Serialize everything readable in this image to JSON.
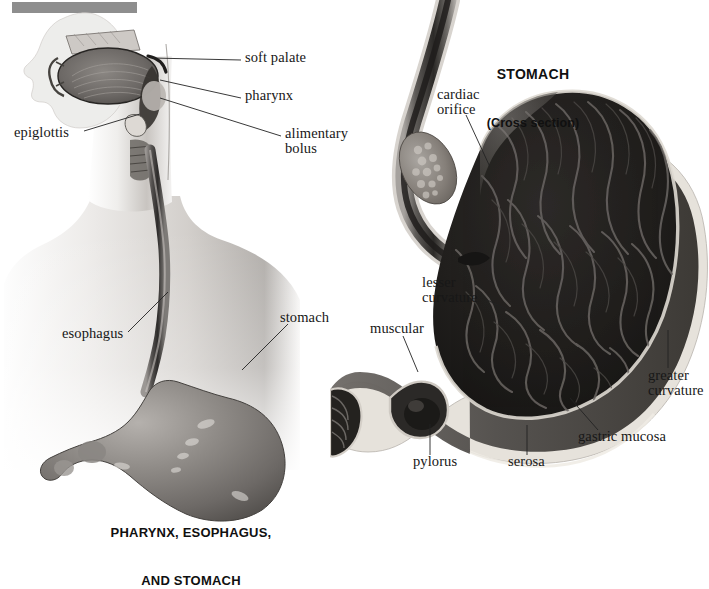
{
  "page": {
    "background_color": "#ffffff",
    "header_bar_color": "#8e8e8e"
  },
  "left_figure": {
    "caption_line1": "PHARYNX, ESOPHAGUS,",
    "caption_line2": "AND STOMACH",
    "labels": [
      {
        "id": "soft-palate",
        "text": "soft palate",
        "x": 245,
        "y": 57
      },
      {
        "id": "pharynx",
        "text": "pharynx",
        "x": 245,
        "y": 95
      },
      {
        "id": "alimentary-bolus",
        "text": "alimentary",
        "x": 285,
        "y": 133
      },
      {
        "id": "alimentary-bolus2",
        "text": "bolus",
        "x": 285,
        "y": 148
      },
      {
        "id": "epiglottis",
        "text": "epiglottis",
        "x": 14,
        "y": 132
      },
      {
        "id": "esophagus",
        "text": "esophagus",
        "x": 62,
        "y": 333
      },
      {
        "id": "stomach",
        "text": "stomach",
        "x": 280,
        "y": 317
      }
    ]
  },
  "right_figure": {
    "title": "STOMACH",
    "subtitle": "(Cross section)",
    "labels": [
      {
        "id": "cardiac-orifice",
        "text": "cardiac",
        "x": 437,
        "y": 94
      },
      {
        "id": "cardiac-orifice2",
        "text": "orifice",
        "x": 437,
        "y": 109
      },
      {
        "id": "lesser-curvature",
        "text": "lesser",
        "x": 422,
        "y": 282
      },
      {
        "id": "lesser-curvature2",
        "text": "curvature",
        "x": 422,
        "y": 297
      },
      {
        "id": "muscular",
        "text": "muscular",
        "x": 370,
        "y": 328
      },
      {
        "id": "greater-curvature",
        "text": "greater",
        "x": 648,
        "y": 375
      },
      {
        "id": "greater-curvature2",
        "text": "curvature",
        "x": 648,
        "y": 390
      },
      {
        "id": "gastric-mucosa",
        "text": "gastric mucosa",
        "x": 578,
        "y": 436
      },
      {
        "id": "serosa",
        "text": "serosa",
        "x": 508,
        "y": 461
      },
      {
        "id": "pylorus",
        "text": "pylorus",
        "x": 413,
        "y": 461
      }
    ]
  },
  "colors": {
    "skin_light": "#f2f0ee",
    "skin_mid": "#d6d2cf",
    "skin_shadow": "#a9a5a2",
    "organ_mid": "#77736f",
    "organ_dark": "#3a3734",
    "lumen_dark": "#1c1a18",
    "serosa_light": "#e8e4dd",
    "leader_line": "#2a2a2a",
    "text": "#171717"
  }
}
